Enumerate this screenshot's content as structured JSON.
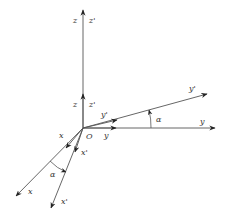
{
  "labels": {
    "z_long": "z",
    "z_prime_long": "z'",
    "z_short": "z",
    "z_prime_short": "z'",
    "y_long": "y",
    "y_prime_long": "y'",
    "y_short": "y",
    "y_prime_short": "y'",
    "x_long": "x",
    "x_prime_long": "x'",
    "x_short": "x",
    "x_prime_short": "x'",
    "origin": "O",
    "alpha_y": "α",
    "alpha_x": "α"
  },
  "colors": {
    "line": "#555555",
    "text": "#333333"
  }
}
